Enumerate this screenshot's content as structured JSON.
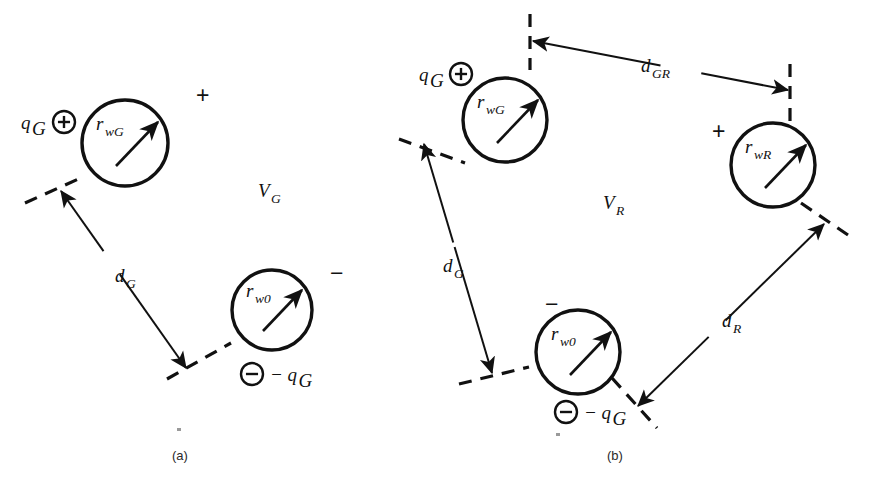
{
  "figure": {
    "background_color": "#ffffff",
    "ink_color": "#111111",
    "width": 876,
    "height": 491
  },
  "panels": [
    {
      "id": "a",
      "caption": "(a)",
      "caption_x": 172,
      "caption_y": 460,
      "potential_label": "V",
      "potential_sub": "G",
      "potential_x": 258,
      "potential_y": 197,
      "plus_sign": "+",
      "plus_x": 196,
      "plus_y": 103,
      "minus_sign": "−",
      "minus_x": 330,
      "minus_y": 281,
      "circles": [
        {
          "name": "conductor-rwg",
          "cx": 125,
          "cy": 143,
          "r": 43,
          "label": "r",
          "label_sub": "wG",
          "label_x": 96,
          "label_y": 130,
          "arrow_x1": 116,
          "arrow_y1": 166,
          "arrow_x2": 158,
          "arrow_y2": 122
        },
        {
          "name": "conductor-rw0",
          "cx": 272,
          "cy": 310,
          "r": 40,
          "label": "r",
          "label_sub": "w0",
          "label_x": 246,
          "label_y": 297,
          "arrow_x1": 263,
          "arrow_y1": 331,
          "arrow_x2": 302,
          "arrow_y2": 290
        }
      ],
      "charges": [
        {
          "name": "charge-positive-qg",
          "symbol": "+",
          "cx": 64,
          "cy": 122,
          "r": 11,
          "text": "q",
          "text_sub": "G",
          "text_x": 21,
          "text_y": 129
        },
        {
          "name": "charge-negative-qg",
          "symbol": "−",
          "cx": 252,
          "cy": 374,
          "r": 11,
          "text": "− q",
          "text_sub": "G",
          "text_x": 270,
          "text_y": 381
        }
      ],
      "tangents": [
        {
          "name": "tangent-upper",
          "x1": 25,
          "y1": 203,
          "x2": 85,
          "y2": 176
        },
        {
          "name": "tangent-lower",
          "x1": 167,
          "y1": 379,
          "x2": 231,
          "y2": 343
        }
      ],
      "dimension": {
        "name": "distance-dg",
        "label": "d",
        "label_sub": "G",
        "label_x": 115,
        "label_y": 282,
        "x1": 61,
        "y1": 191,
        "x2": 186,
        "y2": 368,
        "arrow_start": true,
        "arrow_end": true,
        "gap_start": 0.34,
        "gap_end": 0.47
      }
    },
    {
      "id": "b",
      "caption": "(b)",
      "caption_x": 607,
      "caption_y": 460,
      "potential_label": "V",
      "potential_sub": "R",
      "potential_x": 603,
      "potential_y": 209,
      "plus_sign": "+",
      "plus_x": 712,
      "plus_y": 139,
      "minus_sign": "−",
      "minus_x": 545,
      "minus_y": 312,
      "circles": [
        {
          "name": "conductor-rwg",
          "cx": 505,
          "cy": 120,
          "r": 42,
          "label": "r",
          "label_sub": "wG",
          "label_x": 477,
          "label_y": 108,
          "arrow_x1": 497,
          "arrow_y1": 143,
          "arrow_x2": 538,
          "arrow_y2": 100
        },
        {
          "name": "conductor-rwr",
          "cx": 773,
          "cy": 165,
          "r": 42,
          "label": "r",
          "label_sub": "wR",
          "label_x": 745,
          "label_y": 153,
          "arrow_x1": 765,
          "arrow_y1": 188,
          "arrow_x2": 806,
          "arrow_y2": 145
        },
        {
          "name": "conductor-rw0",
          "cx": 578,
          "cy": 352,
          "r": 42,
          "label": "r",
          "label_sub": "w0",
          "label_x": 551,
          "label_y": 340,
          "arrow_x1": 570,
          "arrow_y1": 375,
          "arrow_x2": 611,
          "arrow_y2": 332
        }
      ],
      "charges": [
        {
          "name": "charge-positive-qg",
          "symbol": "+",
          "cx": 461,
          "cy": 74,
          "r": 11,
          "text": "q",
          "text_sub": "G",
          "text_x": 419,
          "text_y": 81
        },
        {
          "name": "charge-negative-qg",
          "symbol": "−",
          "cx": 566,
          "cy": 412,
          "r": 11,
          "text": "− q",
          "text_sub": "G",
          "text_x": 584,
          "text_y": 419
        }
      ],
      "tangents": [
        {
          "name": "tangent-gr-left",
          "x1": 530,
          "y1": 14,
          "x2": 530,
          "y2": 70
        },
        {
          "name": "tangent-gr-right",
          "x1": 790,
          "y1": 64,
          "x2": 790,
          "y2": 122
        },
        {
          "name": "tangent-dg-top",
          "x1": 399,
          "y1": 139,
          "x2": 465,
          "y2": 163
        },
        {
          "name": "tangent-dg-bottom",
          "x1": 459,
          "y1": 384,
          "x2": 529,
          "y2": 367
        },
        {
          "name": "tangent-dr-top",
          "x1": 801,
          "y1": 203,
          "x2": 848,
          "y2": 235
        },
        {
          "name": "tangent-dr-bottom",
          "x1": 612,
          "y1": 378,
          "x2": 657,
          "y2": 428
        }
      ],
      "dimensions": [
        {
          "name": "distance-dgr",
          "label": "d",
          "label_sub": "GR",
          "label_x": 641,
          "label_y": 72,
          "x1": 788,
          "y1": 90,
          "x2": 533,
          "y2": 41,
          "arrow_start": true,
          "arrow_end": true,
          "gap_start": 0.34,
          "gap_end": 0.5
        },
        {
          "name": "distance-dg",
          "label": "d",
          "label_sub": "G",
          "label_x": 443,
          "label_y": 272,
          "x1": 424,
          "y1": 144,
          "x2": 492,
          "y2": 373,
          "arrow_start": true,
          "arrow_end": true,
          "gap_start": 0.43,
          "gap_end": 0.45
        },
        {
          "name": "distance-dr",
          "label": "d",
          "label_sub": "R",
          "label_x": 722,
          "label_y": 327,
          "x1": 638,
          "y1": 406,
          "x2": 824,
          "y2": 224,
          "arrow_start": true,
          "arrow_end": true,
          "gap_start": 0.38,
          "gap_end": 0.47
        }
      ]
    }
  ],
  "specks": [
    {
      "name": "print-speck",
      "x": 177,
      "y": 428,
      "w": 4,
      "h": 3
    },
    {
      "name": "print-speck",
      "x": 556,
      "y": 433,
      "w": 4,
      "h": 3
    }
  ]
}
